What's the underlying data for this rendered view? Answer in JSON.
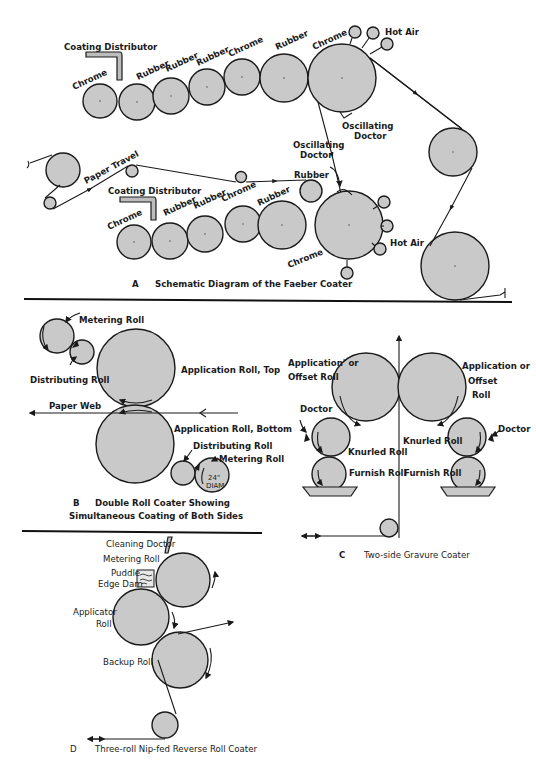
{
  "figure_A": {
    "caption_letter": "A",
    "caption": "Schematic Diagram of the Faeber Coater",
    "upper_train": {
      "coating_distributor": "Coating Distributor",
      "roll_labels": [
        "Chrome",
        "Rubber",
        "Rubber",
        "Rubber",
        "Chrome",
        "Rubber",
        "Chrome"
      ],
      "hot_air": "Hot Air",
      "oscillating_doctor": [
        "Oscillating",
        "Doctor"
      ]
    },
    "lower_train": {
      "paper_travel": "Paper Travel",
      "coating_distributor": "Coating Distributor",
      "roll_labels": [
        "Chrome",
        "Rubber",
        "Rubber",
        "Chrome",
        "Rubber"
      ],
      "rubber_top": "Rubber",
      "chrome_big": "Chrome",
      "hot_air": "Hot Air",
      "oscillating_doctor": [
        "Oscillating",
        "Doctor"
      ]
    }
  },
  "figure_B": {
    "caption_letter": "B",
    "caption_line1": "Double Roll Coater Showing",
    "caption_line2": "Simultaneous Coating of Both Sides",
    "metering_roll_top": "Metering Roll",
    "distributing_roll_top": "Distributing Roll",
    "application_roll_top": "Application Roll, Top",
    "paper_web": "Paper Web",
    "application_roll_bottom": "Application Roll, Bottom",
    "distributing_roll_bottom": "Distributing Roll",
    "metering_roll_bottom": "Metering Roll",
    "diameter_line1": "24\"",
    "diameter_line2": "DIAM"
  },
  "figure_C": {
    "caption_letter": "C",
    "caption": "Two-side Gravure Coater",
    "left_application": [
      "Application' or",
      "Offset Roll"
    ],
    "right_application": [
      "Application or",
      "Offset",
      "Roll"
    ],
    "doctor_left": "Doctor",
    "doctor_right": "Doctor",
    "knurled_left": "Knurled Roll",
    "knurled_right": "Knurled Roll",
    "furnish_left": "Furnish Roll",
    "furnish_right": "Furnish Roll"
  },
  "figure_D": {
    "caption_letter": "D",
    "caption": "Three-roll Nip-fed Reverse Roll Coater",
    "cleaning_doctor": "Cleaning Doctor",
    "metering_roll": "Metering Roll",
    "puddle": "Puddle",
    "edge_dam": "Edge Dam",
    "applicator_roll": [
      "Applicator",
      "Roll"
    ],
    "backup_roll": "Backup Roll"
  },
  "colors": {
    "roll_fill": "#c9c9c9",
    "ink": "#1a1a1a",
    "background": "#ffffff"
  }
}
